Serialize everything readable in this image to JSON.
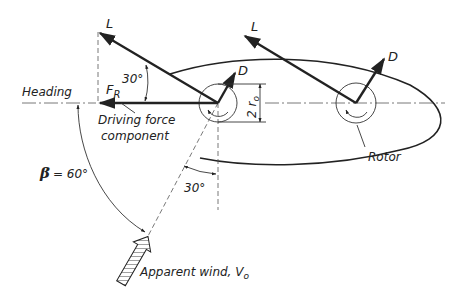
{
  "diagram": {
    "labels": {
      "heading": "Heading",
      "lift_left": "L",
      "drag_left": "D",
      "lift_right": "L",
      "drag_right": "D",
      "resultant": "F",
      "resultant_sub": "R",
      "angle_lift": "30°",
      "diameter": "2 r",
      "diameter_sub": "o",
      "driving_force_1": "Driving force",
      "driving_force_2": "component",
      "angle_wind_offset": "30°",
      "beta_symbol": "β",
      "beta_value": "= 60°",
      "rotor": "Rotor",
      "apparent_wind": "Apparent wind, V",
      "apparent_wind_sub": "o"
    },
    "colors": {
      "ink": "#222222",
      "background": "#ffffff"
    }
  }
}
